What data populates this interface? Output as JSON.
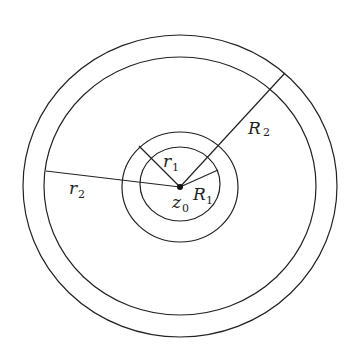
{
  "diagram": {
    "center": {
      "label": "z",
      "subscript": "0",
      "x": 180,
      "y": 187
    },
    "circles": [
      {
        "name": "outer-big",
        "r": 157
      },
      {
        "name": "inner-big",
        "r": 136
      },
      {
        "name": "outer-small",
        "r": 57
      },
      {
        "name": "inner-small",
        "r": 39
      }
    ],
    "radii": [
      {
        "label": "r",
        "subscript": "1",
        "to": [
          139,
          146
        ]
      },
      {
        "label": "R",
        "subscript": "1",
        "to": [
          217,
          170
        ]
      },
      {
        "label": "r",
        "subscript": "2",
        "to": [
          46,
          171
        ]
      },
      {
        "label": "R",
        "subscript": "2",
        "to": [
          285,
          73
        ]
      }
    ],
    "labels": {
      "r1": {
        "main": "r",
        "sub": "1"
      },
      "R1": {
        "main": "R",
        "sub": "1"
      },
      "r2": {
        "main": "r",
        "sub": "2"
      },
      "R2": {
        "main": "R",
        "sub": "2"
      },
      "z0": {
        "main": "z",
        "sub": "0"
      }
    },
    "colors": {
      "stroke": "#222222",
      "background": "#ffffff"
    }
  }
}
